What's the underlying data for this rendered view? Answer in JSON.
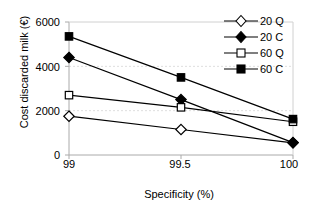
{
  "chart_data": {
    "type": "line",
    "title": "",
    "xlabel": "Specificity (%)",
    "ylabel": "Cost discarded milk (€)",
    "x": [
      99,
      99.5,
      100
    ],
    "xtick_labels": [
      "99",
      "99.5",
      "100"
    ],
    "ytick_labels": [
      "0",
      "2000",
      "4000",
      "6000"
    ],
    "yticks": [
      0,
      2000,
      4000,
      6000
    ],
    "ylim": [
      0,
      6000
    ],
    "xlim": [
      99,
      100
    ],
    "grid": "horizontal-faint",
    "legend_position": "top-right",
    "series": [
      {
        "name": "20 Q",
        "marker": "open-diamond",
        "color": "#000000",
        "values": [
          1750,
          1150,
          550
        ]
      },
      {
        "name": "20 C",
        "marker": "filled-diamond",
        "color": "#000000",
        "values": [
          4400,
          2500,
          560
        ]
      },
      {
        "name": "60 Q",
        "marker": "open-square",
        "color": "#000000",
        "values": [
          2700,
          2150,
          1500
        ]
      },
      {
        "name": "60 C",
        "marker": "filled-square",
        "color": "#000000",
        "values": [
          5350,
          3500,
          1620
        ]
      }
    ]
  },
  "legend": {
    "items": [
      {
        "label": "20 Q",
        "marker": "open-diamond"
      },
      {
        "label": "20 C",
        "marker": "filled-diamond"
      },
      {
        "label": "60 Q",
        "marker": "open-square"
      },
      {
        "label": "60 C",
        "marker": "filled-square"
      }
    ]
  },
  "axes": {
    "y_title": "Cost discarded milk (€)",
    "x_title": "Specificity (%)",
    "y_tick_0": "0",
    "y_tick_1": "2000",
    "y_tick_2": "4000",
    "y_tick_3": "6000",
    "x_tick_0": "99",
    "x_tick_1": "99.5",
    "x_tick_2": "100"
  },
  "colors": {
    "line": "#000000",
    "axis": "#808080",
    "grid": "#d9d9d9",
    "background": "#ffffff"
  }
}
